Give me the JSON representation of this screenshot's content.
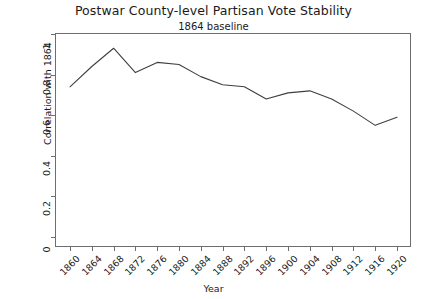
{
  "chart_data": {
    "type": "line",
    "title": "Postwar County-level Partisan Vote Stability",
    "subtitle": "1864 baseline",
    "xlabel": "Year",
    "ylabel": "Correlation with 1864",
    "grid": false,
    "legend": "none",
    "xlim": [
      1860,
      1920
    ],
    "ylim": [
      0,
      1
    ],
    "ytick_labels": [
      "0",
      "0.2",
      "0.4",
      "0.6",
      "0.8",
      "1"
    ],
    "ytick_values": [
      0,
      0.2,
      0.4,
      0.6,
      0.8,
      1
    ],
    "xtick_labels": [
      "1860",
      "1864",
      "1868",
      "1872",
      "1876",
      "1880",
      "1884",
      "1888",
      "1892",
      "1896",
      "1900",
      "1904",
      "1908",
      "1912",
      "1916",
      "1920"
    ],
    "x": [
      1860,
      1864,
      1868,
      1872,
      1876,
      1880,
      1884,
      1888,
      1892,
      1896,
      1900,
      1904,
      1908,
      1912,
      1916,
      1920
    ],
    "values": [
      0.74,
      0.84,
      0.93,
      0.81,
      0.86,
      0.85,
      0.79,
      0.75,
      0.74,
      0.68,
      0.71,
      0.72,
      0.68,
      0.62,
      0.55,
      0.59
    ],
    "series": [
      {
        "name": "Correlation with 1864",
        "color": "#3f3f3f",
        "values": [
          0.74,
          0.84,
          0.93,
          0.81,
          0.86,
          0.85,
          0.79,
          0.75,
          0.74,
          0.68,
          0.71,
          0.72,
          0.68,
          0.62,
          0.55,
          0.59
        ]
      }
    ]
  },
  "style": {
    "axis_color": "#6e6e6e",
    "line_color": "#3f3f3f",
    "background": "#ffffff",
    "text_color": "#1a1a1a"
  }
}
